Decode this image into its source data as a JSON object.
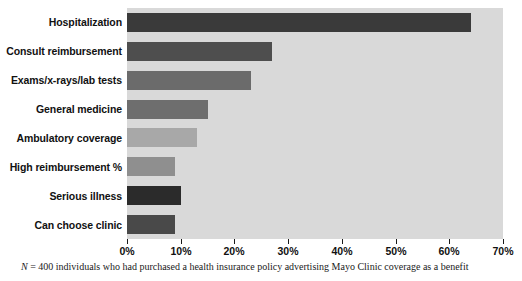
{
  "chart_data": {
    "type": "bar",
    "orientation": "horizontal",
    "title": "",
    "subtitle": "",
    "xlabel": "",
    "ylabel": "",
    "xlim": [
      0,
      70
    ],
    "xtick_step": 10,
    "grid": false,
    "legend": null,
    "categories": [
      "Hospitalization",
      "Consult reimbursement",
      "Exams/x-rays/lab tests",
      "General medicine",
      "Ambulatory coverage",
      "High reimbursement %",
      "Serious illness",
      "Can choose clinic"
    ],
    "values": [
      64,
      27,
      23,
      15,
      13,
      9,
      10,
      9
    ],
    "bar_colors": [
      "#3a3a3a",
      "#4e4e4e",
      "#6b6b6b",
      "#6e6e6e",
      "#a8a8a8",
      "#8f8f8f",
      "#2b2b2b",
      "#494949"
    ],
    "tick_labels": [
      "0%",
      "10%",
      "20%",
      "30%",
      "40%",
      "50%",
      "60%",
      "70%"
    ],
    "tick_values": [
      0,
      10,
      20,
      30,
      40,
      50,
      60,
      70
    ],
    "plot_background": "#d9d9d9",
    "page_background": "#ffffff",
    "annotations": [
      "N = 400 individuals who had purchased a health insurance policy advertising Mayo Clinic coverage as a benefit"
    ]
  },
  "footnote": {
    "n_label": "N",
    "text": " = 400 individuals who had purchased a health insurance policy advertising Mayo Clinic coverage as a benefit"
  }
}
